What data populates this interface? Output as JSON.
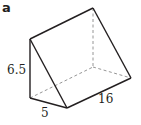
{
  "figure": {
    "panel_label": "a",
    "shape": "triangular prism",
    "dimensions": {
      "height": "6.5",
      "width": "5",
      "length": "16"
    },
    "colors": {
      "stroke": "#231f20",
      "hidden_stroke": "#8a8a8a",
      "background": "#ffffff"
    }
  }
}
